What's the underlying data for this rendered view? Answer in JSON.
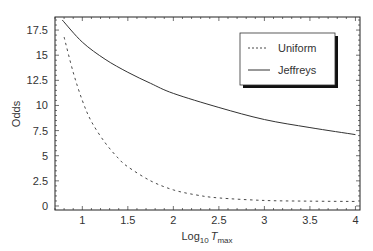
{
  "chart_data": {
    "type": "line",
    "title": "",
    "xlabel": "Log10 Tmax",
    "xlabel_parts": {
      "base": "Log",
      "sub1": "10",
      "var": "T",
      "sub2": "max"
    },
    "ylabel": "Odds",
    "xlim": [
      0.7,
      4.05
    ],
    "ylim": [
      -0.4,
      18.8
    ],
    "xticks": [
      1,
      1.5,
      2,
      2.5,
      3,
      3.5,
      4
    ],
    "xtick_labels": [
      "1",
      "1.5",
      "2",
      "2.5",
      "3",
      "3.5",
      "4"
    ],
    "yticks": [
      0,
      2.5,
      5,
      7.5,
      10,
      12.5,
      15,
      17.5
    ],
    "ytick_labels": [
      "0",
      "2.5",
      "5",
      "7.5",
      "10",
      "12.5",
      "15",
      "17.5"
    ],
    "grid": false,
    "legend_position": "upper right",
    "series": [
      {
        "name": "Uniform",
        "style": "dashed",
        "x": [
          0.8,
          0.9,
          1.0,
          1.1,
          1.25,
          1.4,
          1.5,
          1.75,
          2.0,
          2.25,
          2.5,
          3.0,
          3.5,
          4.0
        ],
        "values": [
          16.8,
          13.3,
          10.5,
          8.4,
          6.3,
          4.7,
          3.9,
          2.5,
          1.6,
          1.1,
          0.8,
          0.55,
          0.48,
          0.45
        ]
      },
      {
        "name": "Jeffreys",
        "style": "solid",
        "x": [
          0.78,
          1.0,
          1.25,
          1.5,
          1.75,
          2.0,
          2.5,
          3.0,
          3.5,
          4.0
        ],
        "values": [
          18.5,
          16.3,
          14.6,
          13.3,
          12.2,
          11.2,
          9.8,
          8.6,
          7.8,
          7.1
        ]
      }
    ]
  },
  "legend": {
    "items": [
      {
        "label": "Uniform",
        "style": "dashed"
      },
      {
        "label": "Jeffreys",
        "style": "solid"
      }
    ]
  },
  "colors": {
    "line": "#333333",
    "frame": "#222222",
    "background": "#ffffff"
  }
}
